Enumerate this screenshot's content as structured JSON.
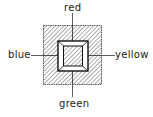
{
  "diagram": {
    "labels": {
      "top": "red",
      "left": "blue",
      "right": "yellow",
      "bottom": "green"
    },
    "colors": {
      "stroke": "#222222",
      "background": "#ffffff"
    }
  }
}
